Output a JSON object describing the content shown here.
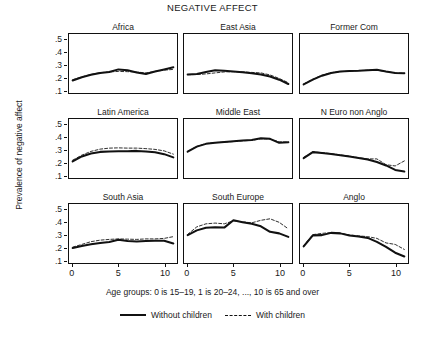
{
  "chart_data": {
    "type": "line",
    "title": "NEGATIVE AFFECT",
    "ylabel": "Prevalence of negative affect",
    "xlabel": "",
    "caption": "Age groups: 0 is 15–19, 1 is 20–24, ..., 10 is 65 and over",
    "grid": false,
    "legend_position": "bottom",
    "ylim": [
      0.08,
      0.55
    ],
    "xlim": [
      -0.4,
      11.4
    ],
    "yticks": [
      ".5",
      ".4",
      ".3",
      ".2",
      ".1"
    ],
    "ytick_values": [
      0.5,
      0.4,
      0.3,
      0.2,
      0.1
    ],
    "xticks": [
      "0",
      "5",
      "10"
    ],
    "xtick_values": [
      0,
      5,
      10
    ],
    "x": [
      0,
      1,
      2,
      3,
      4,
      5,
      6,
      7,
      8,
      9,
      10,
      11
    ],
    "legend": [
      {
        "name": "Without children",
        "style": "solid"
      },
      {
        "name": "With children",
        "style": "dashed"
      }
    ],
    "panels": [
      {
        "title": "Africa",
        "series": [
          {
            "name": "Without children",
            "style": "solid",
            "values": [
              0.18,
              0.205,
              0.225,
              0.24,
              0.247,
              0.268,
              0.262,
              0.244,
              0.232,
              0.252,
              0.268,
              0.285
            ]
          },
          {
            "name": "With children",
            "style": "dashed",
            "values": [
              0.186,
              0.208,
              0.228,
              0.242,
              0.248,
              0.252,
              0.25,
              0.247,
              0.24,
              0.252,
              0.262,
              0.268
            ]
          }
        ]
      },
      {
        "title": "East Asia",
        "series": [
          {
            "name": "Without children",
            "style": "solid",
            "values": [
              0.228,
              0.232,
              0.248,
              0.262,
              0.257,
              0.252,
              0.246,
              0.238,
              0.228,
              0.212,
              0.186,
              0.152
            ]
          },
          {
            "name": "With children",
            "style": "dashed",
            "values": [
              0.226,
              0.227,
              0.232,
              0.24,
              0.248,
              0.25,
              0.248,
              0.244,
              0.24,
              0.224,
              0.196,
              0.162
            ]
          }
        ]
      },
      {
        "title": "Former Com",
        "series": [
          {
            "name": "Without children",
            "style": "solid",
            "values": [
              0.148,
              0.186,
              0.218,
              0.24,
              0.252,
              0.256,
              0.258,
              0.262,
              0.266,
              0.252,
              0.24,
              0.238
            ]
          },
          {
            "name": "With children",
            "style": "dashed",
            "values": [
              0.152,
              0.19,
              0.222,
              0.242,
              0.25,
              0.254,
              0.258,
              0.262,
              0.262,
              0.25,
              0.24,
              0.238
            ]
          }
        ]
      },
      {
        "title": "Latin America",
        "series": [
          {
            "name": "Without children",
            "style": "solid",
            "values": [
              0.212,
              0.252,
              0.275,
              0.288,
              0.292,
              0.293,
              0.294,
              0.296,
              0.292,
              0.285,
              0.27,
              0.244
            ]
          },
          {
            "name": "With children",
            "style": "dashed",
            "values": [
              0.222,
              0.262,
              0.292,
              0.31,
              0.318,
              0.32,
              0.318,
              0.318,
              0.314,
              0.308,
              0.296,
              0.27
            ]
          }
        ]
      },
      {
        "title": "Middle East",
        "series": [
          {
            "name": "Without children",
            "style": "solid",
            "values": [
              0.29,
              0.33,
              0.352,
              0.36,
              0.366,
              0.372,
              0.378,
              0.382,
              0.396,
              0.392,
              0.36,
              0.364
            ]
          },
          {
            "name": "With children",
            "style": "dashed",
            "values": [
              0.292,
              0.332,
              0.354,
              0.362,
              0.366,
              0.37,
              0.376,
              0.38,
              0.392,
              0.39,
              0.368,
              0.366
            ]
          }
        ]
      },
      {
        "title": "N Euro non Anglo",
        "series": [
          {
            "name": "Without children",
            "style": "solid",
            "values": [
              0.238,
              0.286,
              0.28,
              0.272,
              0.262,
              0.252,
              0.24,
              0.228,
              0.208,
              0.18,
              0.144,
              0.132
            ]
          },
          {
            "name": "With children",
            "style": "dashed",
            "values": [
              0.244,
              0.288,
              0.282,
              0.274,
              0.264,
              0.254,
              0.242,
              0.232,
              0.232,
              0.186,
              0.176,
              0.216
            ]
          }
        ]
      },
      {
        "title": "South Asia",
        "series": [
          {
            "name": "Without children",
            "style": "solid",
            "values": [
              0.2,
              0.216,
              0.23,
              0.24,
              0.248,
              0.266,
              0.256,
              0.252,
              0.256,
              0.258,
              0.258,
              0.236
            ]
          },
          {
            "name": "With children",
            "style": "dashed",
            "values": [
              0.206,
              0.228,
              0.25,
              0.262,
              0.268,
              0.272,
              0.27,
              0.268,
              0.272,
              0.272,
              0.276,
              0.29
            ]
          }
        ]
      },
      {
        "title": "South Europe",
        "series": [
          {
            "name": "Without children",
            "style": "solid",
            "values": [
              0.302,
              0.34,
              0.36,
              0.364,
              0.362,
              0.42,
              0.404,
              0.392,
              0.372,
              0.328,
              0.316,
              0.288
            ]
          },
          {
            "name": "With children",
            "style": "dashed",
            "values": [
              0.308,
              0.368,
              0.392,
              0.398,
              0.392,
              0.416,
              0.408,
              0.4,
              0.42,
              0.432,
              0.404,
              0.352
            ]
          }
        ]
      },
      {
        "title": "Anglo",
        "series": [
          {
            "name": "Without children",
            "style": "solid",
            "values": [
              0.212,
              0.3,
              0.302,
              0.32,
              0.316,
              0.3,
              0.292,
              0.28,
              0.248,
              0.208,
              0.162,
              0.132
            ]
          },
          {
            "name": "With children",
            "style": "dashed",
            "values": [
              0.218,
              0.306,
              0.316,
              0.322,
              0.318,
              0.304,
              0.296,
              0.29,
              0.276,
              0.24,
              0.228,
              0.188
            ]
          }
        ]
      }
    ]
  }
}
